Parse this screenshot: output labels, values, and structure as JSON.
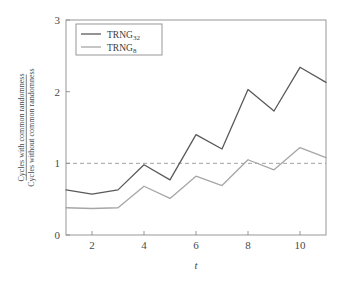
{
  "chart_data": {
    "type": "line",
    "title": "",
    "xlabel": "t",
    "ylabel_numerator": "Cycles with common randomness",
    "ylabel_denominator": "Cycles without common randomness",
    "x": [
      1,
      2,
      3,
      4,
      5,
      6,
      7,
      8,
      9,
      10,
      11
    ],
    "xlim": [
      1,
      11
    ],
    "ylim": [
      0,
      3
    ],
    "xticks": [
      2,
      4,
      6,
      8,
      10
    ],
    "xtick_labels": [
      "2",
      "4",
      "6",
      "8",
      "10"
    ],
    "yticks": [
      0,
      1,
      2,
      3
    ],
    "ytick_labels": [
      "0",
      "1",
      "2",
      "3"
    ],
    "grid": false,
    "reference_line": {
      "y": 1,
      "style": "dashed",
      "color": "#9a9a9a"
    },
    "legend_position": "top-left",
    "series": [
      {
        "name": "TRNG32",
        "name_base": "TRNG",
        "name_sub": "32",
        "color": "#5a5a5a",
        "values": [
          0.63,
          0.57,
          0.63,
          0.98,
          0.77,
          1.4,
          1.2,
          2.03,
          1.73,
          2.34,
          2.13
        ]
      },
      {
        "name": "TRNG8",
        "name_base": "TRNG",
        "name_sub": "8",
        "color": "#a6a6a6",
        "values": [
          0.38,
          0.37,
          0.38,
          0.68,
          0.51,
          0.82,
          0.69,
          1.05,
          0.91,
          1.22,
          1.08
        ]
      }
    ]
  }
}
